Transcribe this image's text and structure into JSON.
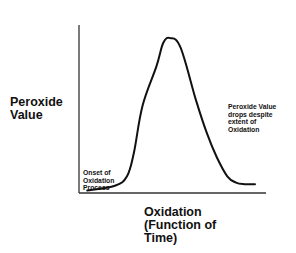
{
  "chart_data": {
    "type": "line",
    "title": "",
    "xlabel": "Oxidation\n(Function  of\nTime)",
    "ylabel": "Peroxide\nValue",
    "xlim": [
      0,
      100
    ],
    "ylim": [
      0,
      100
    ],
    "grid": false,
    "legend": null,
    "ticks": {
      "x": [],
      "y": []
    },
    "series": [
      {
        "name": "Peroxide Value",
        "color": "#111111",
        "x": [
          3,
          19,
          26,
          30,
          35,
          43,
          47,
          51,
          57,
          66,
          72,
          78,
          84,
          89,
          94,
          100
        ],
        "y": [
          1,
          4,
          10,
          25,
          55,
          80,
          95,
          98,
          92,
          58,
          38,
          22,
          10,
          6,
          5,
          5
        ]
      }
    ],
    "annotations": [
      {
        "text": "Onset of\nOxidation\nProcess",
        "position": "lower-left, near curve start"
      },
      {
        "text": "Peroxide Value\ndrops despite\nextent of\nOxidation",
        "position": "right side, beside falling curve"
      }
    ]
  },
  "labels": {
    "ylabel": "Peroxide\nValue",
    "xlabel": "Oxidation\n(Function  of\nTime)",
    "annot_onset": "Onset of\nOxidation\nProcess",
    "annot_drop": "Peroxide Value\ndrops despite\nextent of\nOxidation"
  },
  "colors": {
    "axis": "#333333",
    "curve": "#111111",
    "background": "#ffffff"
  }
}
